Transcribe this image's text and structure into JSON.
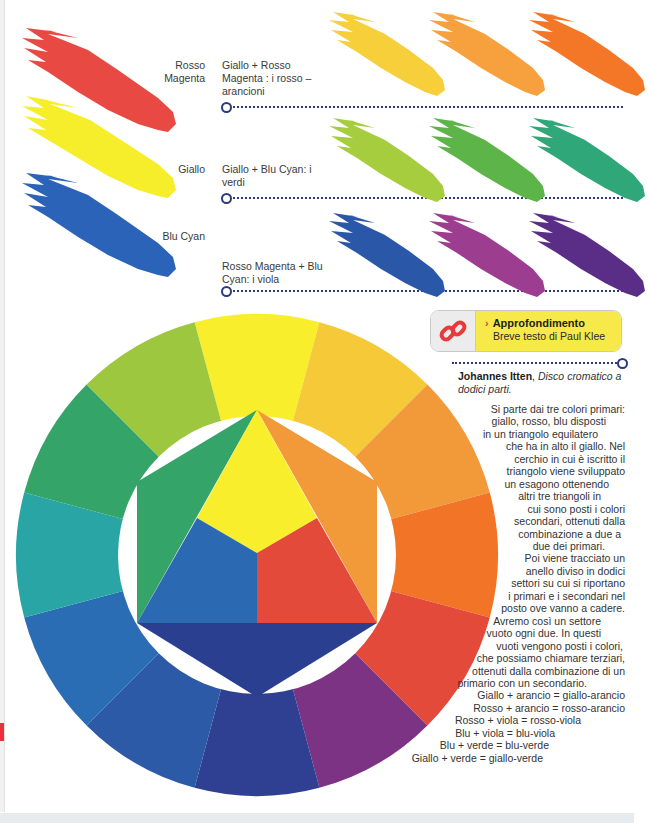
{
  "primaries": [
    {
      "id": "rosso-magenta",
      "label": "Rosso\nMagenta",
      "color": "#e84a43"
    },
    {
      "id": "giallo",
      "label": "Giallo",
      "color": "#f7ee2b"
    },
    {
      "id": "blu-cyan",
      "label": "Blu Cyan",
      "color": "#2a63b8"
    }
  ],
  "mixes": [
    {
      "label": "Giallo + Rosso Magenta : i rosso – arancioni",
      "swatches": [
        "#f6cf3a",
        "#f6a13d",
        "#f47727"
      ]
    },
    {
      "label": "Giallo + Blu Cyan: i verdi",
      "swatches": [
        "#a6cd3e",
        "#5db449",
        "#2fa778"
      ]
    },
    {
      "label": "Rosso Magenta + Blu Cyan: i viola",
      "swatches": [
        "#2b57a8",
        "#9c3d8f",
        "#5a2d86"
      ]
    }
  ],
  "callout": {
    "title": "Approfondimento",
    "subtitle": "Breve testo di Paul Klee",
    "chevron": "›",
    "icon": "link-icon",
    "accent": "#f7e94a",
    "icon_color": "#e8393d"
  },
  "caption": {
    "author": "Johannes Itten",
    "title": "Disco cromatico a dodici parti."
  },
  "body": [
    "Si parte dai tre colori primari:",
    "giallo, rosso, blu disposti",
    "in un triangolo equilatero",
    "che ha in alto il giallo. Nel",
    "cerchio in cui è iscritto il",
    "triangolo viene sviluppato",
    "un esagono ottenendo",
    "altri tre triangoli in",
    "cui sono posti i colori",
    "secondari, ottenuti dalla",
    "combinazione a due a",
    "due dei primari.",
    "Poi viene tracciato un",
    "anello diviso in dodici",
    "settori su cui si riportano",
    "i primari e i secondari nel",
    "posto ove vanno a cadere.",
    "Avremo così un settore",
    "vuoto ogni due. In questi",
    "vuoti vengono posti i colori,",
    "che possiamo chiamare terziari,",
    "ottenuti dalla combinazione di un",
    "primario con un secondario.",
    "Giallo + arancio = giallo-arancio",
    "Rosso + arancio = rosso-arancio",
    "Rosso + viola = rosso-viola",
    "Blu + viola = blu-viola",
    "Blu + verde = blu-verde",
    "Giallo + verde = giallo-verde"
  ],
  "wheel": {
    "sectors": [
      {
        "name": "giallo",
        "color": "#f8ee2c"
      },
      {
        "name": "giallo-arancio",
        "color": "#f6c938"
      },
      {
        "name": "arancio",
        "color": "#f29a3a"
      },
      {
        "name": "rosso-arancio",
        "color": "#f27427"
      },
      {
        "name": "rosso",
        "color": "#e44a39"
      },
      {
        "name": "rosso-viola",
        "color": "#7c3384"
      },
      {
        "name": "viola",
        "color": "#2f3f91"
      },
      {
        "name": "blu-viola",
        "color": "#2c5aa6"
      },
      {
        "name": "blu",
        "color": "#2a6db5"
      },
      {
        "name": "blu-verde",
        "color": "#2aa5a6"
      },
      {
        "name": "verde",
        "color": "#34a468"
      },
      {
        "name": "giallo-verde",
        "color": "#9cc73f"
      }
    ],
    "inner": {
      "yellow": "#f9ee2c",
      "red": "#e44a3a",
      "blue": "#2b6ab3",
      "orange": "#f29a3a",
      "green": "#34a468",
      "violet": "#2a3f8f"
    }
  }
}
